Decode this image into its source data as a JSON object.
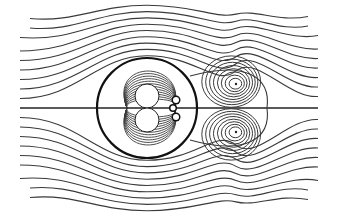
{
  "figure": {
    "colors": {
      "background": "#ffffff",
      "line": "#3a3a3a",
      "body": "#111111"
    },
    "body_circle": {
      "cx": 147,
      "cy": 108,
      "r": 50
    },
    "axis_line": {
      "x1": 20,
      "x2": 318,
      "y": 108
    },
    "inner_lobes": [
      {
        "cx": 147,
        "cy": 96,
        "r": 12
      },
      {
        "cx": 147,
        "cy": 120,
        "r": 12
      }
    ],
    "small_dots": [
      {
        "cx": 176,
        "cy": 100,
        "r": 3
      },
      {
        "cx": 173,
        "cy": 108,
        "r": 2.5
      },
      {
        "cx": 176,
        "cy": 117,
        "r": 3
      }
    ],
    "vortices": [
      {
        "cx": 236,
        "cy": 84,
        "rings": 8
      },
      {
        "cx": 236,
        "cy": 132,
        "rings": 8
      }
    ],
    "separatrix": {
      "x_start": 190,
      "x_end": 267,
      "y_top": 66,
      "y_bottom": 150
    }
  }
}
